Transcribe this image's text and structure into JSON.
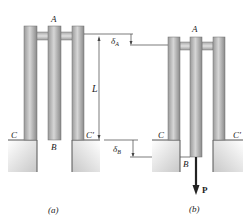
{
  "figure": {
    "colors": {
      "bar_light": "#cfcfcf",
      "bar_dark": "#8e8e8e",
      "bar_edge": "#6f6f6f",
      "ground_fill": "#e2e2e2",
      "ground_edge": "#555555",
      "line": "#333333",
      "load_arrow": "#222222"
    },
    "panel_a": {
      "caption": "(a)",
      "label_top": "A",
      "label_bottom_mid": "B",
      "label_left_support": "C",
      "label_right_support": "C′"
    },
    "dimensions": {
      "length_label": "L",
      "delta_a_label": "δ",
      "delta_a_sub": "A",
      "delta_b_label": "δ",
      "delta_b_sub": "B"
    },
    "panel_b": {
      "caption": "(b)",
      "label_top": "A",
      "label_bottom_mid": "B",
      "label_left_support": "C",
      "label_right_support": "C′",
      "load_label": "P"
    }
  }
}
